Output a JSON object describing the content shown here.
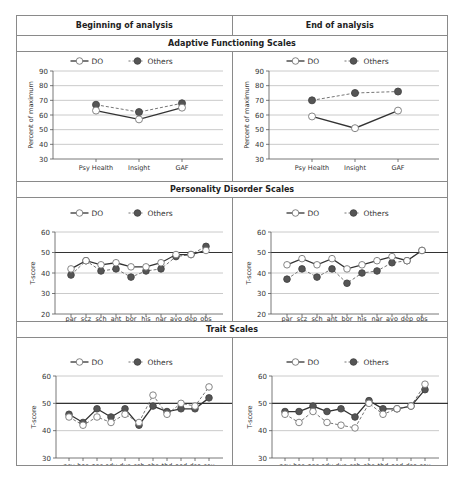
{
  "table": {
    "col_headers": [
      "Beginning of analysis",
      "End of analysis"
    ],
    "sections": [
      {
        "title": "Adaptive Functioning Scales"
      },
      {
        "title": "Personality Disorder Scales"
      },
      {
        "title": "Trait Scales"
      }
    ]
  },
  "legend": {
    "do_label": "DO",
    "others_label": "Others"
  },
  "colors": {
    "do_fill": "#ffffff",
    "others_fill": "#555555",
    "line": "#333333",
    "grid": "#bdbdbd",
    "reference": "#333333"
  },
  "chart_data": [
    {
      "id": "af_begin",
      "type": "line",
      "section": "Adaptive Functioning Scales",
      "panel": "Beginning of analysis",
      "ylabel": "Percent of maximum",
      "ylim": [
        30,
        90
      ],
      "yticks": [
        30,
        40,
        50,
        60,
        70,
        80,
        90
      ],
      "categories": [
        "Psy Health",
        "Insight",
        "GAF"
      ],
      "series": [
        {
          "name": "DO",
          "values": [
            63,
            57,
            65
          ],
          "style": "solid",
          "marker": "open"
        },
        {
          "name": "Others",
          "values": [
            67,
            62,
            68
          ],
          "style": "dashed",
          "marker": "filled"
        }
      ],
      "reference_line": null,
      "grid": true,
      "legend_position": "top"
    },
    {
      "id": "af_end",
      "type": "line",
      "section": "Adaptive Functioning Scales",
      "panel": "End of analysis",
      "ylabel": "Percent of maximum",
      "ylim": [
        30,
        90
      ],
      "yticks": [
        30,
        40,
        50,
        60,
        70,
        80,
        90
      ],
      "categories": [
        "Psy Health",
        "Insight",
        "GAF"
      ],
      "series": [
        {
          "name": "DO",
          "values": [
            59,
            51,
            63
          ],
          "style": "solid",
          "marker": "open"
        },
        {
          "name": "Others",
          "values": [
            70,
            75,
            76
          ],
          "style": "dashed",
          "marker": "filled"
        }
      ],
      "reference_line": null,
      "grid": true,
      "legend_position": "top"
    },
    {
      "id": "pd_begin",
      "type": "line",
      "section": "Personality Disorder Scales",
      "panel": "Beginning of analysis",
      "ylabel": "T-score",
      "ylim": [
        20,
        60
      ],
      "yticks": [
        20,
        30,
        40,
        50,
        60
      ],
      "categories": [
        "par",
        "scz",
        "sch",
        "ant",
        "bor",
        "his",
        "nar",
        "avo",
        "dep",
        "obs"
      ],
      "series": [
        {
          "name": "DO",
          "values": [
            42,
            46,
            44,
            45,
            43,
            43,
            45,
            49,
            49,
            51
          ],
          "style": "solid",
          "marker": "open"
        },
        {
          "name": "Others",
          "values": [
            39,
            46,
            41,
            42,
            38,
            41,
            42,
            48,
            49,
            53
          ],
          "style": "dashed",
          "marker": "filled"
        }
      ],
      "reference_line": 50,
      "grid": true,
      "legend_position": "top"
    },
    {
      "id": "pd_end",
      "type": "line",
      "section": "Personality Disorder Scales",
      "panel": "End of analysis",
      "ylabel": "T-score",
      "ylim": [
        20,
        60
      ],
      "yticks": [
        20,
        30,
        40,
        50,
        60
      ],
      "categories": [
        "par",
        "scz",
        "sch",
        "ant",
        "bor",
        "his",
        "nar",
        "avo",
        "dep",
        "obs"
      ],
      "series": [
        {
          "name": "DO",
          "values": [
            44,
            47,
            44,
            47,
            42,
            44,
            46,
            48,
            46,
            51
          ],
          "style": "solid",
          "marker": "open"
        },
        {
          "name": "Others",
          "values": [
            37,
            42,
            38,
            42,
            35,
            40,
            41,
            45,
            46,
            51
          ],
          "style": "dashed",
          "marker": "filled"
        }
      ],
      "reference_line": 50,
      "grid": true,
      "legend_position": "top"
    },
    {
      "id": "tr_begin",
      "type": "line",
      "section": "Trait Scales",
      "panel": "Beginning of analysis",
      "ylabel": "T-score",
      "ylim": [
        30,
        60
      ],
      "yticks": [
        30,
        40,
        50,
        60
      ],
      "categories": [
        "psy",
        "hos",
        "nar",
        "edy",
        "dys",
        "sch",
        "obs",
        "thd",
        "oed",
        "dsc",
        "sex"
      ],
      "series": [
        {
          "name": "DO",
          "values": [
            45,
            42,
            45,
            43,
            46,
            43,
            53,
            46,
            50,
            49,
            56
          ],
          "style": "dashed",
          "marker": "open"
        },
        {
          "name": "Others",
          "values": [
            46,
            43,
            48,
            45,
            48,
            42,
            49,
            47,
            48,
            48,
            52
          ],
          "style": "solid",
          "marker": "filled"
        }
      ],
      "reference_line": 50,
      "grid": true,
      "legend_position": "top"
    },
    {
      "id": "tr_end",
      "type": "line",
      "section": "Trait Scales",
      "panel": "End of analysis",
      "ylabel": "T-score",
      "ylim": [
        30,
        60
      ],
      "yticks": [
        30,
        40,
        50,
        60
      ],
      "categories": [
        "psy",
        "hos",
        "nar",
        "edy",
        "dys",
        "sch",
        "obs",
        "thd",
        "oed",
        "dsc",
        "sex"
      ],
      "series": [
        {
          "name": "DO",
          "values": [
            46,
            43,
            47,
            43,
            42,
            41,
            50,
            46,
            48,
            49,
            57
          ],
          "style": "dashed",
          "marker": "open"
        },
        {
          "name": "Others",
          "values": [
            47,
            47,
            49,
            47,
            48,
            45,
            51,
            48,
            48,
            49,
            55
          ],
          "style": "solid",
          "marker": "filled"
        }
      ],
      "reference_line": 50,
      "grid": true,
      "legend_position": "top"
    }
  ]
}
